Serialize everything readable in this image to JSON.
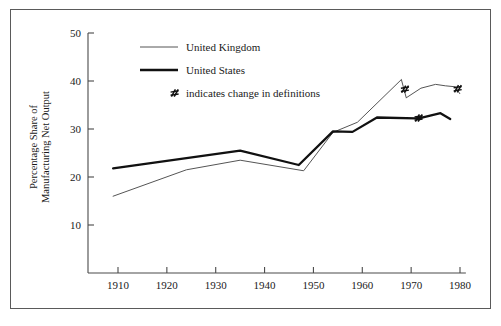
{
  "chart_data": {
    "type": "line",
    "title": "",
    "xlabel": "",
    "ylabel": "Percentage Share of Manufacturing Net Output",
    "xlim": [
      1903,
      1983
    ],
    "ylim": [
      0,
      50
    ],
    "xticks": [
      1910,
      1920,
      1930,
      1940,
      1950,
      1960,
      1970,
      1980
    ],
    "xtick_labels": [
      "1910",
      "1920",
      "1930",
      "1940",
      "1950",
      "1960",
      "1970",
      "1980"
    ],
    "yticks": [
      10,
      20,
      30,
      40,
      50
    ],
    "ytick_labels": [
      "10",
      "20",
      "30",
      "40",
      "50"
    ],
    "grid": false,
    "legend_position": "upper-left-inside",
    "series": [
      {
        "name": "United Kingdom",
        "style": "thin",
        "color": "#555555",
        "segments": [
          [
            [
              1909,
              16.0
            ],
            [
              1924,
              21.5
            ],
            [
              1935,
              23.5
            ],
            [
              1948,
              21.3
            ],
            [
              1954,
              29.3
            ],
            [
              1959,
              31.4
            ],
            [
              1968,
              40.3
            ]
          ],
          [
            [
              1969,
              36.5
            ],
            [
              1972,
              38.5
            ],
            [
              1975,
              39.3
            ],
            [
              1977,
              39.0
            ],
            [
              1979,
              38.8
            ]
          ],
          [
            [
              1980,
              37.3
            ]
          ]
        ]
      },
      {
        "name": "United States",
        "style": "thick",
        "color": "#111111",
        "segments": [
          [
            [
              1909,
              21.8
            ],
            [
              1935,
              25.5
            ],
            [
              1947,
              22.5
            ],
            [
              1954,
              29.5
            ],
            [
              1958,
              29.4
            ],
            [
              1963,
              32.4
            ],
            [
              1971,
              32.2
            ]
          ],
          [
            [
              1972,
              32.3
            ],
            [
              1976,
              33.3
            ],
            [
              1978,
              32.1
            ]
          ]
        ]
      }
    ],
    "break_markers": [
      {
        "series": "United Kingdom",
        "x": 1968.6,
        "y": 38.3
      },
      {
        "series": "United Kingdom",
        "x": 1979.4,
        "y": 38.4
      },
      {
        "series": "United States",
        "x": 1971.4,
        "y": 32.3
      }
    ],
    "annotations": []
  },
  "legend": {
    "items": [
      {
        "label": "United Kingdom",
        "marker": "thin-line"
      },
      {
        "label": "United States",
        "marker": "thick-line"
      },
      {
        "label": "indicates change in definitions",
        "marker": "break-symbol"
      }
    ]
  },
  "axis": {
    "y_title": "Percentage Share of Manufacturing Net Output"
  }
}
